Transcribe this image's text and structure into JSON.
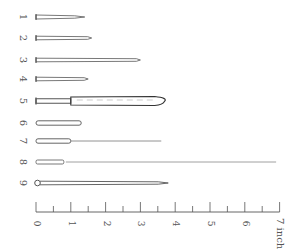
{
  "figure": {
    "title": "",
    "items": [
      {
        "label": "1",
        "y": 17,
        "length_in": 1.4,
        "type": "pin-tapered-point"
      },
      {
        "label": "2",
        "y": 38,
        "length_in": 1.6,
        "type": "pin-straight"
      },
      {
        "label": "3",
        "y": 60,
        "length_in": 3.0,
        "type": "pin-long"
      },
      {
        "label": "4",
        "y": 79,
        "length_in": 1.5,
        "type": "pin-short"
      },
      {
        "label": "5",
        "y": 101,
        "length_in": 3.7,
        "type": "pin-with-sheath"
      },
      {
        "label": "6",
        "y": 123,
        "length_in": 1.3,
        "type": "rod-rounded"
      },
      {
        "label": "7",
        "y": 141,
        "length_in": 3.6,
        "type": "rod-with-fine-wire"
      },
      {
        "label": "8",
        "y": 162,
        "length_in": 6.9,
        "type": "rod-with-long-wire"
      },
      {
        "label": "9",
        "y": 183,
        "length_in": 3.8,
        "type": "looped-head-needle"
      }
    ],
    "scale": {
      "ticks": [
        "0",
        "1",
        "2",
        "3",
        "4",
        "5",
        "6",
        "7"
      ],
      "unit": "inch",
      "unit_label": "7 inch",
      "x0": 36,
      "px_per_inch": 34.8,
      "baseline_y": 212
    }
  }
}
